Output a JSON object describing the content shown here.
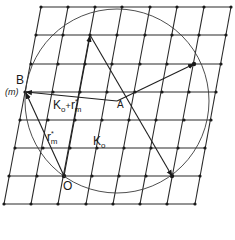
{
  "figure": {
    "type": "reciprocal-lattice-ewald-construction",
    "labels": {
      "B": "B",
      "m": "(m)",
      "A": "A",
      "O": "O",
      "K_plus_r_main": "K",
      "K_plus_r_sub": "o",
      "K_plus_r_plus": "+",
      "K_plus_r_r": "r",
      "K_plus_r_r_sub": "m",
      "K_plus_r_r_sup": "*",
      "r_main": "r",
      "r_sub": "m",
      "r_sup": "*",
      "K_main": "K",
      "K_sub": "o"
    },
    "colors": {
      "ink": "#1a1a1a",
      "background": "#ffffff"
    }
  }
}
